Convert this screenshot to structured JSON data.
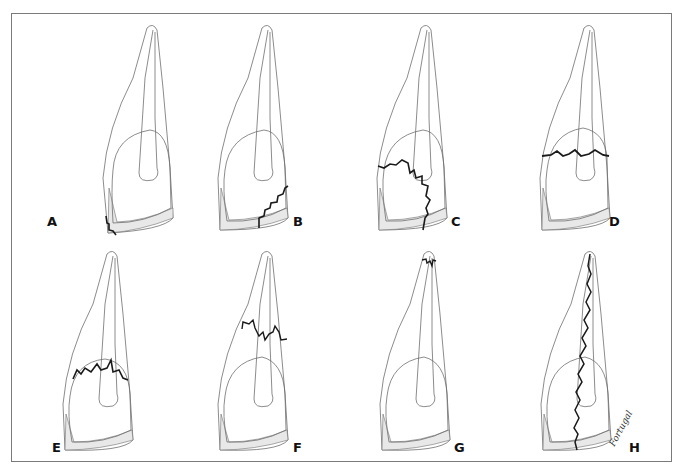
{
  "figure": {
    "panels": [
      {
        "id": "A",
        "label": "A",
        "fracture": "enamel corner (incisal-labial)"
      },
      {
        "id": "B",
        "label": "B",
        "fracture": "enamel-dentin crown"
      },
      {
        "id": "C",
        "label": "C",
        "fracture": "crown with pulp exposure"
      },
      {
        "id": "D",
        "label": "D",
        "fracture": "horizontal crown near cervical"
      },
      {
        "id": "E",
        "label": "E",
        "fracture": "crown-root cervical"
      },
      {
        "id": "F",
        "label": "F",
        "fracture": "horizontal root mid-third"
      },
      {
        "id": "G",
        "label": "G",
        "fracture": "apical root"
      },
      {
        "id": "H",
        "label": "H",
        "fracture": "vertical root"
      }
    ],
    "signature": "Fortugal"
  },
  "colors": {
    "outline": "#6e6e6e",
    "fracture": "#1a1a1a",
    "enamel_fill": "#e8e8e8",
    "frame": "#7a7a7a"
  }
}
